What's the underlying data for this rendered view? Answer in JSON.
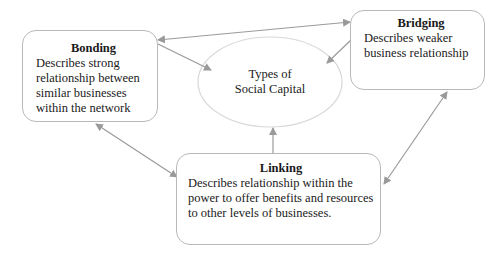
{
  "diagram": {
    "center": {
      "line1": "Types of",
      "line2": "Social Capital"
    },
    "nodes": {
      "bonding": {
        "title": "Bonding",
        "description": "Describes strong relationship between similar businesses within the network"
      },
      "bridging": {
        "title": "Bridging",
        "description": "Describes weaker business relationship"
      },
      "linking": {
        "title": "Linking",
        "description": "Describes relationship within the power to offer benefits and resources to other levels of businesses."
      }
    },
    "edges": [
      {
        "from": "bonding",
        "to": "bridging",
        "style": "double-arrow"
      },
      {
        "from": "bonding",
        "to": "center",
        "style": "arrow"
      },
      {
        "from": "bridging",
        "to": "center",
        "style": "arrow"
      },
      {
        "from": "linking",
        "to": "center",
        "style": "arrow"
      },
      {
        "from": "bonding",
        "to": "linking",
        "style": "double-arrow"
      },
      {
        "from": "bridging",
        "to": "linking",
        "style": "double-arrow"
      }
    ],
    "colors": {
      "line": "#9a9a9a",
      "ellipse_border": "#d8d8d8",
      "box_border": "#b8b8b8"
    }
  }
}
